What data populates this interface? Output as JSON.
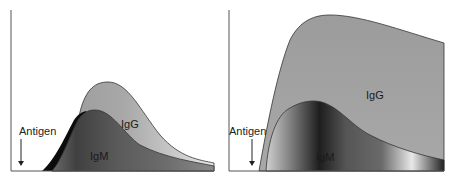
{
  "panels": [
    {
      "id": "primary-response",
      "antigen_label": "Antigen",
      "igg_label": "IgG",
      "igm_label": "IgM"
    },
    {
      "id": "secondary-response",
      "antigen_label": "Antigen",
      "igg_label": "IgG",
      "igm_label": "IgM"
    }
  ],
  "colors": {
    "igg_fill": "#a6a6a6",
    "igm_fill_dark": "#3a3a3a",
    "igm_fill_light": "#d8d8d8",
    "axis": "#555555",
    "outline": "#333333"
  }
}
